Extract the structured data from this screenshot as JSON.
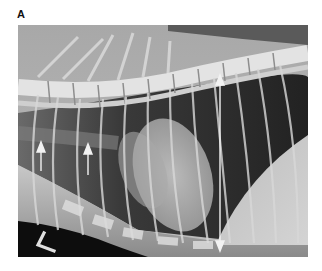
{
  "figure": {
    "panel_label": "A",
    "image_type": "lateral thoracic radiograph",
    "annotations": {
      "arrows_up": 2,
      "double_headed_arrow": "vertical thoracic depth measurement",
      "side_marker": "L"
    },
    "colors": {
      "background": "#ffffff",
      "bone": "#e6e6e6",
      "soft_tissue": "#b5b5b5",
      "lung": "#2a2a2a",
      "annotation": "#f2f2f2"
    }
  }
}
